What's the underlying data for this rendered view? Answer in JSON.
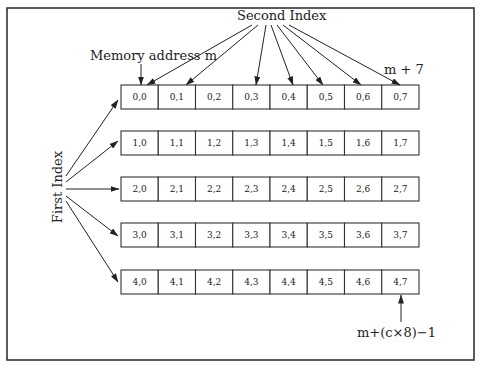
{
  "diagram": {
    "labels": {
      "memory_address": "Memory address m",
      "second_index": "Second Index",
      "first_index": "First Index",
      "end_of_first_row": "m + 7",
      "last_address": "m+(c×8)−1"
    },
    "rows": [
      [
        "0,0",
        "0,1",
        "0,2",
        "0,3",
        "0,4",
        "0,5",
        "0,6",
        "0,7"
      ],
      [
        "1,0",
        "1,1",
        "1,2",
        "1,3",
        "1,4",
        "1,5",
        "1,6",
        "1,7"
      ],
      [
        "2,0",
        "2,1",
        "2,2",
        "2,3",
        "2,4",
        "2,5",
        "2,6",
        "2,7"
      ],
      [
        "3,0",
        "3,1",
        "3,2",
        "3,3",
        "3,4",
        "3,5",
        "3,6",
        "3,7"
      ],
      [
        "4,0",
        "4,1",
        "4,2",
        "4,3",
        "4,4",
        "4,5",
        "4,6",
        "4,7"
      ]
    ],
    "second_index_targets": [
      0,
      1,
      3,
      4,
      5,
      6,
      7
    ],
    "first_index_targets": [
      0,
      1,
      2,
      3,
      4
    ]
  }
}
